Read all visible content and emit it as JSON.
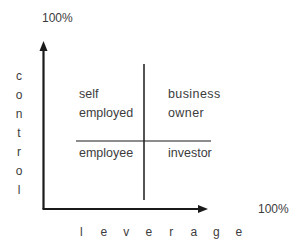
{
  "diagram": {
    "type": "quadrant",
    "y_axis": {
      "label": "control",
      "letters": [
        "c",
        "o",
        "n",
        "t",
        "r",
        "o",
        "l"
      ],
      "max_label": "100%"
    },
    "x_axis": {
      "label": "leverage",
      "letters": [
        "l",
        "e",
        "v",
        "e",
        "r",
        "a",
        "g",
        "e"
      ],
      "max_label": "100%"
    },
    "quadrants": {
      "top_left": {
        "line1": "self",
        "line2": "employed"
      },
      "top_right": {
        "line1": "business",
        "line2": "owner"
      },
      "bottom_left": {
        "line1": "employee"
      },
      "bottom_right": {
        "line1": "investor"
      }
    },
    "colors": {
      "line": "#1a1a1a",
      "text": "#3c3c3c",
      "background": "#ffffff"
    }
  }
}
